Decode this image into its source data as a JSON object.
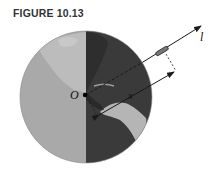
{
  "figure": {
    "title": "FIGURE 10.13",
    "labels": {
      "origin": "O",
      "distance": "x",
      "line": "l"
    },
    "colors": {
      "light_half": "#a9a9a9",
      "dark_half": "#3a3a3a",
      "land_light": "#c4c4c4",
      "land_dark": "#2a2a2a",
      "lines": "#1a1a1a"
    }
  }
}
